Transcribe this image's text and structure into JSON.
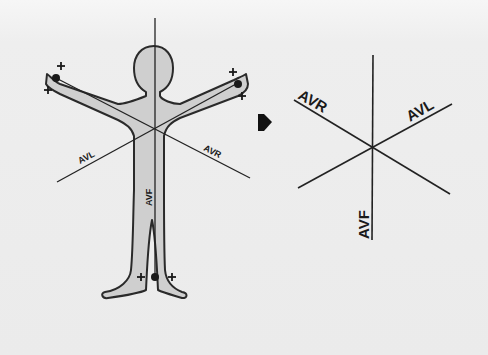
{
  "diagram": {
    "left_figure": {
      "labels": {
        "avl": "AVL",
        "avr": "AVR",
        "avf": "AVF"
      },
      "plus_signs": [
        "+",
        "+",
        "+",
        "+",
        "+",
        "+"
      ],
      "electrodes": [
        "right-arm",
        "left-arm",
        "left-foot"
      ]
    },
    "arrow": "right-arrow",
    "right_figure": {
      "labels": {
        "avr": "AVR",
        "avl": "AVL",
        "avf": "AVF"
      }
    },
    "colors": {
      "background": "#ececec",
      "body_fill": "#cfcfcf",
      "outline": "#2a2a2a",
      "line": "#222222"
    }
  }
}
